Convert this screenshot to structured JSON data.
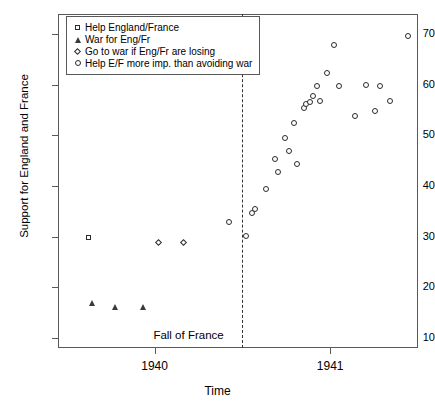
{
  "chart_data": {
    "type": "scatter",
    "title": "",
    "xlabel": "Time",
    "ylabel": "Support for England and France",
    "xtick_labels": [
      "1940",
      "1941"
    ],
    "ytick_labels": [
      "10",
      "20",
      "30",
      "40",
      "50",
      "60",
      "70"
    ],
    "ylim": [
      8,
      74
    ],
    "xlim": [
      1939.45,
      1941.5
    ],
    "grid": false,
    "legend_position": "top-left",
    "annotations": [
      {
        "text": "Fall of France",
        "x": 1940.5,
        "note": "dashed vertical line at Fall of France"
      }
    ],
    "series": [
      {
        "name": "Help England/France",
        "marker": "square",
        "points": [
          {
            "x": 1939.62,
            "y": 30.0
          }
        ]
      },
      {
        "name": "War for Eng/Fr",
        "marker": "triangle",
        "points": [
          {
            "x": 1939.64,
            "y": 17.0
          },
          {
            "x": 1939.77,
            "y": 16.3
          },
          {
            "x": 1939.93,
            "y": 16.3
          }
        ]
      },
      {
        "name": "Go to war if Eng/Fr are losing",
        "marker": "diamond",
        "points": [
          {
            "x": 1940.02,
            "y": 29.0
          },
          {
            "x": 1940.16,
            "y": 29.0
          }
        ]
      },
      {
        "name": "Help E/F more imp. than avoiding war",
        "marker": "circle",
        "points": [
          {
            "x": 1940.42,
            "y": 33.0
          },
          {
            "x": 1940.52,
            "y": 30.3
          },
          {
            "x": 1940.55,
            "y": 34.8
          },
          {
            "x": 1940.57,
            "y": 35.5
          },
          {
            "x": 1940.63,
            "y": 39.5
          },
          {
            "x": 1940.68,
            "y": 45.5
          },
          {
            "x": 1940.7,
            "y": 42.8
          },
          {
            "x": 1940.74,
            "y": 49.5
          },
          {
            "x": 1940.76,
            "y": 47.0
          },
          {
            "x": 1940.79,
            "y": 52.5
          },
          {
            "x": 1940.81,
            "y": 44.5
          },
          {
            "x": 1940.85,
            "y": 55.5
          },
          {
            "x": 1940.86,
            "y": 56.3
          },
          {
            "x": 1940.88,
            "y": 56.8
          },
          {
            "x": 1940.9,
            "y": 57.8
          },
          {
            "x": 1940.92,
            "y": 59.8
          },
          {
            "x": 1940.94,
            "y": 57.0
          },
          {
            "x": 1940.98,
            "y": 62.5
          },
          {
            "x": 1941.02,
            "y": 68.0
          },
          {
            "x": 1941.05,
            "y": 59.8
          },
          {
            "x": 1941.14,
            "y": 54.0
          },
          {
            "x": 1941.2,
            "y": 60.0
          },
          {
            "x": 1941.25,
            "y": 55.0
          },
          {
            "x": 1941.28,
            "y": 59.8
          },
          {
            "x": 1941.34,
            "y": 57.0
          },
          {
            "x": 1941.44,
            "y": 69.8
          }
        ]
      }
    ]
  },
  "legend": {
    "items": [
      {
        "label": "Help England/France",
        "marker": "square"
      },
      {
        "label": "War for Eng/Fr",
        "marker": "triangle"
      },
      {
        "label": "Go to war if Eng/Fr are losing",
        "marker": "diamond"
      },
      {
        "label": "Help E/F more imp. than avoiding war",
        "marker": "circle"
      }
    ]
  }
}
